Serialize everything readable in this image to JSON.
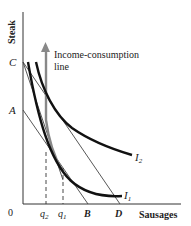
{
  "diagram": {
    "axes": {
      "y_label": "Steak",
      "x_label": "Sausages",
      "origin_label": "0"
    },
    "y_points": [
      {
        "label": "C"
      },
      {
        "label": "A"
      }
    ],
    "x_points": [
      {
        "label": "q",
        "sub": "2"
      },
      {
        "label": "q",
        "sub": "1"
      },
      {
        "label": "B"
      },
      {
        "label": "D"
      }
    ],
    "curves": [
      {
        "label": "I",
        "sub": "2"
      },
      {
        "label": "I",
        "sub": "1"
      }
    ],
    "annotation": {
      "line1": "Income-consumption",
      "line2": "line"
    },
    "colors": {
      "axis": "#333333",
      "indifference": "#111111",
      "budget": "#444444",
      "icc": "#888888"
    }
  }
}
